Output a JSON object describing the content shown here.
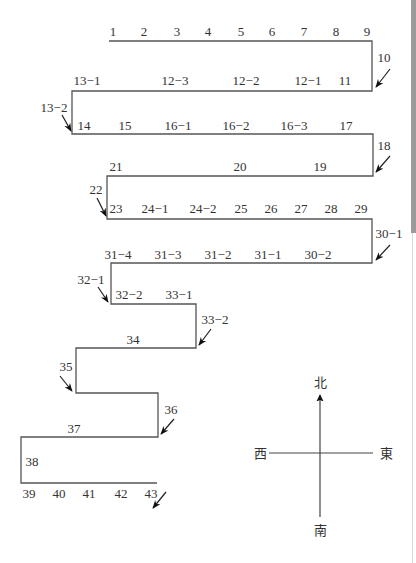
{
  "diagram": {
    "path_points": "109,41 372,41 372,91 72,91 72,134 373,134 373,176 107,176 107,219 372,219 372,263 111,263 111,304 196,304 196,348 76,348 76,393 158,393 158,437 21,437 21,483 157,483",
    "labels": [
      {
        "text": "1",
        "x": 113,
        "y": 36
      },
      {
        "text": "2",
        "x": 144,
        "y": 36
      },
      {
        "text": "3",
        "x": 177,
        "y": 36
      },
      {
        "text": "4",
        "x": 208,
        "y": 36
      },
      {
        "text": "5",
        "x": 241,
        "y": 36
      },
      {
        "text": "6",
        "x": 272,
        "y": 36
      },
      {
        "text": "7",
        "x": 304,
        "y": 36
      },
      {
        "text": "8",
        "x": 336,
        "y": 36
      },
      {
        "text": "9",
        "x": 367,
        "y": 36
      },
      {
        "text": "10",
        "x": 384,
        "y": 62
      },
      {
        "text": "13−1",
        "x": 87,
        "y": 85
      },
      {
        "text": "12−3",
        "x": 175,
        "y": 85
      },
      {
        "text": "12−2",
        "x": 246,
        "y": 85
      },
      {
        "text": "12−1",
        "x": 308,
        "y": 85
      },
      {
        "text": "11",
        "x": 345,
        "y": 85
      },
      {
        "text": "13−2",
        "x": 54,
        "y": 112
      },
      {
        "text": "14",
        "x": 84,
        "y": 130
      },
      {
        "text": "15",
        "x": 125,
        "y": 130
      },
      {
        "text": "16−1",
        "x": 178,
        "y": 130
      },
      {
        "text": "16−2",
        "x": 236,
        "y": 130
      },
      {
        "text": "16−3",
        "x": 294,
        "y": 130
      },
      {
        "text": "17",
        "x": 346,
        "y": 130
      },
      {
        "text": "18",
        "x": 384,
        "y": 150
      },
      {
        "text": "21",
        "x": 116,
        "y": 171
      },
      {
        "text": "20",
        "x": 240,
        "y": 171
      },
      {
        "text": "19",
        "x": 320,
        "y": 171
      },
      {
        "text": "22",
        "x": 96,
        "y": 194
      },
      {
        "text": "23",
        "x": 116,
        "y": 213
      },
      {
        "text": "24−1",
        "x": 155,
        "y": 213
      },
      {
        "text": "24−2",
        "x": 203,
        "y": 213
      },
      {
        "text": "25",
        "x": 241,
        "y": 213
      },
      {
        "text": "26",
        "x": 271,
        "y": 213
      },
      {
        "text": "27",
        "x": 301,
        "y": 213
      },
      {
        "text": "28",
        "x": 331,
        "y": 213
      },
      {
        "text": "29",
        "x": 361,
        "y": 213
      },
      {
        "text": "30−1",
        "x": 389,
        "y": 238
      },
      {
        "text": "31−4",
        "x": 118,
        "y": 259
      },
      {
        "text": "31−3",
        "x": 168,
        "y": 259
      },
      {
        "text": "31−2",
        "x": 218,
        "y": 259
      },
      {
        "text": "31−1",
        "x": 268,
        "y": 259
      },
      {
        "text": "30−2",
        "x": 318,
        "y": 259
      },
      {
        "text": "32−1",
        "x": 91,
        "y": 284
      },
      {
        "text": "32−2",
        "x": 129,
        "y": 299
      },
      {
        "text": "33−1",
        "x": 179,
        "y": 299
      },
      {
        "text": "33−2",
        "x": 215,
        "y": 324
      },
      {
        "text": "34",
        "x": 133,
        "y": 344
      },
      {
        "text": "35",
        "x": 66,
        "y": 371
      },
      {
        "text": "36",
        "x": 171,
        "y": 414
      },
      {
        "text": "37",
        "x": 74,
        "y": 433
      },
      {
        "text": "38",
        "x": 32,
        "y": 466
      },
      {
        "text": "39",
        "x": 29,
        "y": 498
      },
      {
        "text": "40",
        "x": 59,
        "y": 498
      },
      {
        "text": "41",
        "x": 89,
        "y": 498
      },
      {
        "text": "42",
        "x": 121,
        "y": 498
      },
      {
        "text": "43",
        "x": 151,
        "y": 498
      }
    ],
    "arrows": [
      {
        "x1": 390,
        "y1": 69,
        "x2": 376,
        "y2": 87
      },
      {
        "x1": 62,
        "y1": 115,
        "x2": 71,
        "y2": 131
      },
      {
        "x1": 390,
        "y1": 156,
        "x2": 376,
        "y2": 172
      },
      {
        "x1": 97,
        "y1": 198,
        "x2": 106,
        "y2": 216
      },
      {
        "x1": 390,
        "y1": 245,
        "x2": 376,
        "y2": 260
      },
      {
        "x1": 98,
        "y1": 287,
        "x2": 108,
        "y2": 302
      },
      {
        "x1": 211,
        "y1": 329,
        "x2": 199,
        "y2": 345
      },
      {
        "x1": 60,
        "y1": 376,
        "x2": 72,
        "y2": 391
      },
      {
        "x1": 174,
        "y1": 419,
        "x2": 161,
        "y2": 434
      },
      {
        "x1": 166,
        "y1": 492,
        "x2": 153,
        "y2": 508
      }
    ]
  },
  "compass": {
    "north": "北",
    "south": "南",
    "east": "東",
    "west": "西"
  }
}
